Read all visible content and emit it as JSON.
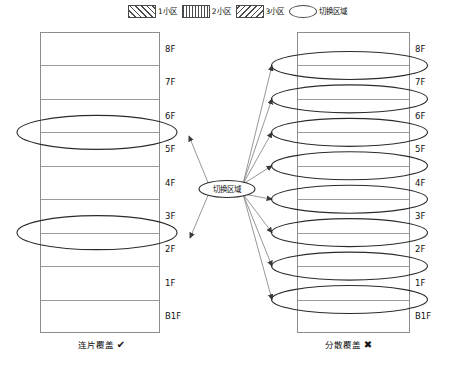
{
  "legend": {
    "items": [
      {
        "label": "1小区",
        "swatch": "hatch-forward-slash-swatch",
        "pattern": "p1"
      },
      {
        "label": "2小区",
        "swatch": "hatch-vertical-swatch",
        "pattern": "p2"
      },
      {
        "label": "3小区",
        "swatch": "hatch-back-slash-swatch",
        "pattern": "p3"
      },
      {
        "label": "切换区域",
        "swatch": "ellipse-swatch",
        "pattern": "ellipse"
      }
    ]
  },
  "center_node": {
    "label": "切换区域"
  },
  "left_building": {
    "caption": "连片覆盖",
    "mark": "✔",
    "floors": [
      {
        "label": "8F",
        "pattern": "p1",
        "cell": "1小区"
      },
      {
        "label": "7F",
        "pattern": "p1",
        "cell": "1小区"
      },
      {
        "label": "6F",
        "pattern": "p1",
        "cell": "1小区"
      },
      {
        "label": "5F",
        "pattern": "p2",
        "cell": "2小区"
      },
      {
        "label": "4F",
        "pattern": "p2",
        "cell": "2小区"
      },
      {
        "label": "3F",
        "pattern": "p2",
        "cell": "2小区"
      },
      {
        "label": "2F",
        "pattern": "p3",
        "cell": "3小区"
      },
      {
        "label": "1F",
        "pattern": "p3",
        "cell": "3小区"
      },
      {
        "label": "B1F",
        "pattern": "p3",
        "cell": "3小区"
      }
    ],
    "handover_zones": 2
  },
  "right_building": {
    "caption": "分散覆盖",
    "mark": "✖",
    "floors": [
      {
        "label": "8F",
        "pattern": "p1",
        "cell": "1小区"
      },
      {
        "label": "7F",
        "pattern": "p2",
        "cell": "2小区"
      },
      {
        "label": "6F",
        "pattern": "p3",
        "cell": "3小区"
      },
      {
        "label": "5F",
        "pattern": "p1",
        "cell": "1小区"
      },
      {
        "label": "4F",
        "pattern": "p2",
        "cell": "2小区"
      },
      {
        "label": "3F",
        "pattern": "p3",
        "cell": "3小区"
      },
      {
        "label": "2F",
        "pattern": "p1",
        "cell": "1小区"
      },
      {
        "label": "1F",
        "pattern": "p2",
        "cell": "2小区"
      },
      {
        "label": "B1F",
        "pattern": "p3",
        "cell": "3小区"
      }
    ],
    "handover_zones": 8
  },
  "colors": {
    "hatch": "#5a5a5a",
    "outline": "#8d8d8d",
    "ellipse": "#2b2b2b",
    "ray": "#8b8b8b",
    "text": "#111111"
  }
}
